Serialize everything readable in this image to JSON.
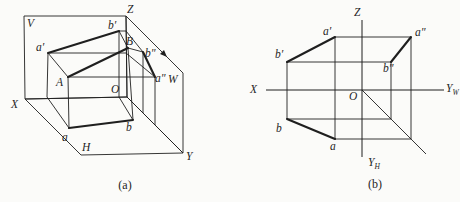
{
  "colors": {
    "ink": "#1f1f1f",
    "paper": "#fbfbf9"
  },
  "figure": {
    "caption_a": "(a)",
    "caption_b": "(b)",
    "panel_a": {
      "planes": {
        "V": "V",
        "H": "H",
        "W": "W"
      },
      "axes": {
        "X": "X",
        "Y": "Y",
        "Z": "Z",
        "O": "O"
      },
      "points": {
        "a_prime": "a′",
        "b_prime": "b′",
        "A": "A",
        "B": "B",
        "a": "a",
        "b": "b",
        "a_dprime": "a″",
        "b_dprime": "b″"
      }
    },
    "panel_b": {
      "axes": {
        "X": "X",
        "Z": "Z",
        "O": "O",
        "Y_main": "Y",
        "YW_sub": "W",
        "YH_sub": "H"
      },
      "points": {
        "a_prime": "a′",
        "b_prime": "b′",
        "a": "a",
        "b": "b",
        "a_dprime": "a″",
        "b_dprime": "b″"
      }
    }
  }
}
